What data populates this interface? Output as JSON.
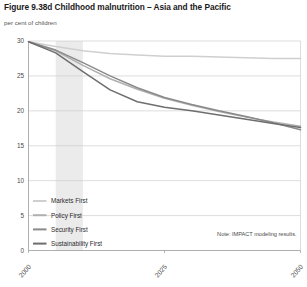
{
  "figure": {
    "title": "Figure 9.38d Childhood malnutrition – Asia and the Pacific",
    "subtitle": "per cent of children",
    "note": "Note: IMPACT modeling results."
  },
  "chart_data": {
    "type": "line",
    "title": "Figure 9.38d Childhood malnutrition – Asia and the Pacific",
    "subtitle": "per cent of children",
    "xlabel": "",
    "ylabel": "per cent of children",
    "xlim": [
      2000,
      2050
    ],
    "ylim": [
      0,
      30
    ],
    "yticks": [
      0,
      5,
      10,
      15,
      20,
      25,
      30
    ],
    "ytick_labels": [
      "0",
      "5",
      "10",
      "15",
      "20",
      "25",
      "30"
    ],
    "xticks": [
      2000,
      2025,
      2050
    ],
    "xtick_labels": [
      "2000",
      "2025",
      "2050"
    ],
    "grid": "horizontal",
    "legend_position": "lower-left-inside",
    "shaded_band": {
      "x_start": 2005,
      "x_end": 2010,
      "color": "#ebebeb"
    },
    "annotation": "Note: IMPACT modeling results.",
    "x": [
      2000,
      2005,
      2010,
      2015,
      2020,
      2025,
      2030,
      2035,
      2040,
      2045,
      2050
    ],
    "series": [
      {
        "name": "Markets First",
        "color": "#cfcfcf",
        "values": [
          29.9,
          29.2,
          28.6,
          28.2,
          28.0,
          27.8,
          27.8,
          27.7,
          27.6,
          27.5,
          27.5
        ]
      },
      {
        "name": "Policy First",
        "color": "#b0b0b0",
        "values": [
          29.9,
          28.6,
          26.5,
          24.6,
          23.1,
          21.8,
          20.8,
          19.9,
          19.1,
          18.4,
          17.8
        ]
      },
      {
        "name": "Security First",
        "color": "#8a8a8a",
        "values": [
          29.9,
          28.7,
          26.9,
          25.0,
          23.3,
          21.9,
          20.9,
          20.0,
          19.2,
          18.3,
          17.3
        ]
      },
      {
        "name": "Sustainability First",
        "color": "#6e6e6e",
        "values": [
          29.9,
          28.3,
          25.6,
          23.0,
          21.3,
          20.5,
          20.0,
          19.4,
          18.8,
          18.2,
          17.6
        ]
      }
    ]
  },
  "legend": {
    "items": [
      {
        "label": "Markets First",
        "color": "#cfcfcf"
      },
      {
        "label": "Policy First",
        "color": "#b0b0b0"
      },
      {
        "label": "Security First",
        "color": "#8a8a8a"
      },
      {
        "label": "Sustainability First",
        "color": "#6e6e6e"
      }
    ]
  }
}
